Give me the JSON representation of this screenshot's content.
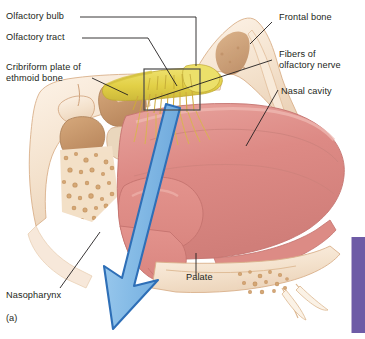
{
  "figure": {
    "caption": "(a)",
    "airflow_arrow": {
      "name": "inhaled-air-arrow",
      "direction": "downward-left",
      "fill_color": "#8cbfe8",
      "outline_color": "#2e6fb7"
    },
    "inset_box": {
      "name": "olfactory-epithelium-inset-box",
      "outline_color": "#4a4a4a"
    },
    "side_bar_color": "#6e5ba6"
  },
  "labels": {
    "left": [
      {
        "id": "olfactory-bulb",
        "text": "Olfactory bulb"
      },
      {
        "id": "olfactory-tract",
        "text": "Olfactory tract"
      },
      {
        "id": "cribriform-plate",
        "line1": "Cribriform plate of",
        "line2": "ethmoid bone"
      },
      {
        "id": "nasopharynx",
        "text": "Nasopharynx"
      }
    ],
    "right": [
      {
        "id": "frontal-bone",
        "text": "Frontal bone"
      },
      {
        "id": "olfactory-nerve",
        "line1": "Fibers of",
        "line2": "olfactory nerve"
      },
      {
        "id": "nasal-cavity",
        "text": "Nasal cavity"
      }
    ],
    "bottom": [
      {
        "id": "palate",
        "text": "Palate"
      }
    ]
  },
  "colors": {
    "mucosa_pink": "#dd8a85",
    "mucosa_pink_light": "#e9a7a1",
    "bone_cream": "#f6e6d5",
    "turbinate_tan": "#c99a6e",
    "olfactory_yellow": "#e4d24a",
    "nerve_gold": "#d9b84a",
    "outline_brown": "#8a5a3c",
    "leader_line": "#231f20",
    "arrow_fill": "#8cbfe8",
    "arrow_outline": "#2e6fb7",
    "sidebar_purple": "#6e5ba6"
  }
}
